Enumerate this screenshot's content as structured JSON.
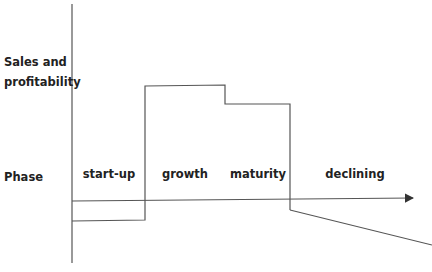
{
  "diagram": {
    "y_axis_label_line1": "Sales and",
    "y_axis_label_line2": "profitability",
    "row_label": "Phase",
    "phases": [
      {
        "label": "start-up"
      },
      {
        "label": "growth"
      },
      {
        "label": "maturity"
      },
      {
        "label": "declining"
      }
    ],
    "colors": {
      "line": "#555555",
      "text": "#222222",
      "background": "#ffffff"
    }
  }
}
